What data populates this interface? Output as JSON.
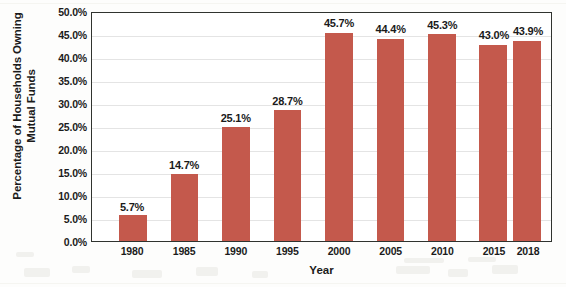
{
  "chart_data": {
    "type": "bar",
    "title": "",
    "categories": [
      "1980",
      "1985",
      "1990",
      "1995",
      "2000",
      "2005",
      "2010",
      "2015",
      "2018"
    ],
    "values": [
      5.7,
      14.7,
      25.1,
      28.7,
      45.7,
      44.4,
      45.3,
      43.0,
      43.9
    ],
    "data_labels": [
      "5.7%",
      "14.7%",
      "25.1%",
      "28.7%",
      "45.7%",
      "44.4%",
      "45.3%",
      "43.0%",
      "43.9%"
    ],
    "xlabel": "Year",
    "ylabel": "Percentage of Households Owning\nMutual Funds",
    "ylim": [
      0,
      50
    ],
    "ytick_values": [
      0,
      5,
      10,
      15,
      20,
      25,
      30,
      35,
      40,
      45,
      50
    ],
    "ytick_labels": [
      "0.0%",
      "5.0%",
      "10.0%",
      "15.0%",
      "20.0%",
      "25.0%",
      "30.0%",
      "35.0%",
      "40.0%",
      "45.0%",
      "50.0%"
    ],
    "grid": true,
    "grid_axis": "y",
    "legend": false,
    "legend_position": "none",
    "bar_color": "#C4594C",
    "plot_border_color": "#30332F",
    "gridline_color": "#E4E4E4",
    "label_color": "#1A1A1A",
    "background_color": "#FFFFFF",
    "bar_slots": [
      {
        "category": "1980",
        "center_pct": 8.9,
        "width_pct": 6.0
      },
      {
        "category": "1985",
        "center_pct": 20.2,
        "width_pct": 6.0
      },
      {
        "category": "1990",
        "center_pct": 31.4,
        "width_pct": 6.0
      },
      {
        "category": "1995",
        "center_pct": 42.6,
        "width_pct": 6.0
      },
      {
        "category": "2000",
        "center_pct": 53.8,
        "width_pct": 6.0
      },
      {
        "category": "2005",
        "center_pct": 65.0,
        "width_pct": 6.0
      },
      {
        "category": "2010",
        "center_pct": 76.2,
        "width_pct": 6.0
      },
      {
        "category": "2015",
        "center_pct": 87.4,
        "width_pct": 6.0
      },
      {
        "category": "2018",
        "center_pct": 94.8,
        "width_pct": 6.0
      }
    ]
  }
}
